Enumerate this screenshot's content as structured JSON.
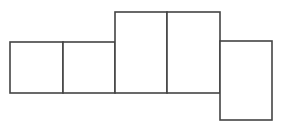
{
  "diagram": {
    "type": "rectangle-net",
    "stroke_color": "#444444",
    "fill_color": "#ffffff",
    "stroke_width": 1.6,
    "shapes": [
      {
        "id": "rect-1",
        "x": 10,
        "y": 42,
        "w": 53,
        "h": 51
      },
      {
        "id": "rect-2",
        "x": 63,
        "y": 42,
        "w": 52,
        "h": 51
      },
      {
        "id": "rect-3",
        "x": 115,
        "y": 12,
        "w": 52,
        "h": 81
      },
      {
        "id": "rect-4",
        "x": 167,
        "y": 12,
        "w": 53,
        "h": 81
      },
      {
        "id": "rect-5",
        "x": 220,
        "y": 41,
        "w": 52,
        "h": 79
      }
    ]
  }
}
